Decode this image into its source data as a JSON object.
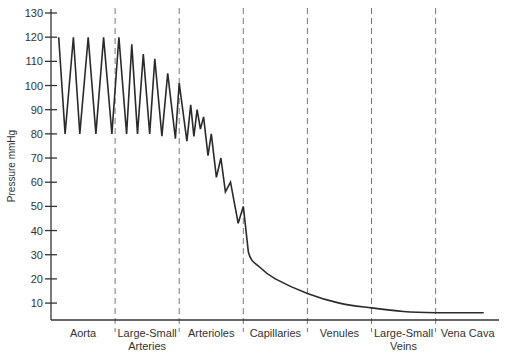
{
  "chart_data": {
    "type": "line",
    "title": "",
    "xlabel": "",
    "ylabel": "Pressure mmHg",
    "ylim": [
      3,
      130
    ],
    "yticks": [
      10,
      20,
      30,
      40,
      50,
      60,
      70,
      80,
      90,
      100,
      110,
      120,
      130
    ],
    "grid": false,
    "legend": null,
    "categories": [
      "Aorta",
      "Large-Small Arteries",
      "Arterioles",
      "Capillaries",
      "Venules",
      "Large-Small Veins",
      "Vena Cava"
    ],
    "category_labels": [
      [
        "Aorta"
      ],
      [
        "Large-Small",
        "Arteries"
      ],
      [
        "Arterioles"
      ],
      [
        "Capillaries"
      ],
      [
        "Venules"
      ],
      [
        "Large-Small",
        "Veins"
      ],
      [
        "Vena Cava"
      ]
    ],
    "segment_boundaries_note": "Vertical dashed lines separate the 7 vessel segments",
    "series": [
      {
        "name": "Blood pressure",
        "points": [
          [
            0.12,
            120
          ],
          [
            0.22,
            80
          ],
          [
            0.35,
            120
          ],
          [
            0.45,
            80
          ],
          [
            0.58,
            120
          ],
          [
            0.7,
            80
          ],
          [
            0.82,
            120
          ],
          [
            0.95,
            80
          ],
          [
            1.06,
            120
          ],
          [
            1.18,
            80
          ],
          [
            1.26,
            117
          ],
          [
            1.35,
            80
          ],
          [
            1.44,
            113
          ],
          [
            1.54,
            80
          ],
          [
            1.62,
            111
          ],
          [
            1.73,
            79
          ],
          [
            1.82,
            105
          ],
          [
            1.94,
            78
          ],
          [
            2.0,
            101
          ],
          [
            2.12,
            77
          ],
          [
            2.18,
            92
          ],
          [
            2.23,
            79
          ],
          [
            2.28,
            90
          ],
          [
            2.33,
            82
          ],
          [
            2.38,
            87
          ],
          [
            2.45,
            71
          ],
          [
            2.5,
            80
          ],
          [
            2.58,
            62
          ],
          [
            2.65,
            70
          ],
          [
            2.72,
            56
          ],
          [
            2.8,
            60
          ],
          [
            2.92,
            43
          ],
          [
            3.0,
            50
          ],
          [
            3.08,
            31
          ],
          [
            3.25,
            25
          ],
          [
            3.5,
            20
          ],
          [
            4.0,
            14
          ],
          [
            4.5,
            10
          ],
          [
            5.0,
            8
          ],
          [
            5.5,
            6.5
          ],
          [
            6.0,
            6
          ],
          [
            6.75,
            6
          ]
        ]
      }
    ]
  }
}
